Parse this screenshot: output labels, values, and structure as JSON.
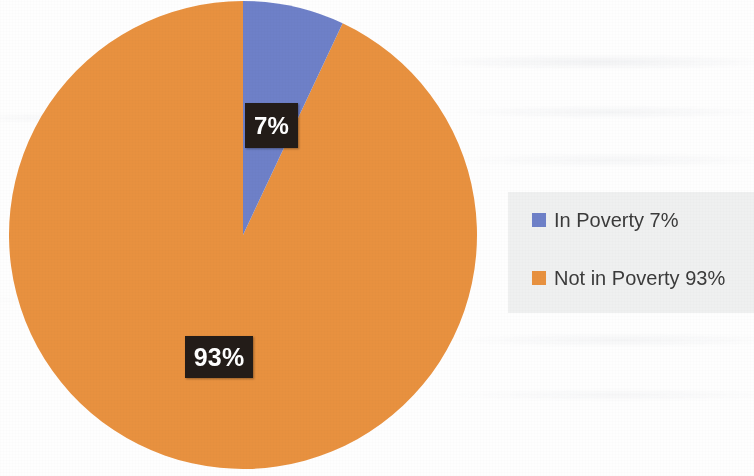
{
  "chart_data": {
    "type": "pie",
    "title": "",
    "subtitle": "",
    "categories": [
      "In Poverty",
      "Not in Poverty"
    ],
    "values": [
      7,
      93
    ],
    "unit": "%",
    "colors": [
      "#6e80c8",
      "#e8913f"
    ],
    "start_angle_deg": 0,
    "direction": "clockwise",
    "legend_position": "right",
    "grid": false,
    "data_labels": [
      "7%",
      "93%"
    ],
    "slices": [
      {
        "name": "In Poverty",
        "value": 7,
        "label": "7%",
        "legend_text": "In Poverty 7%",
        "color": "#6e80c8",
        "angle_deg": 25.2
      },
      {
        "name": "Not in Poverty",
        "value": 93,
        "label": "93%",
        "legend_text": "Not in Poverty 93%",
        "color": "#e8913f",
        "angle_deg": 334.8
      }
    ]
  },
  "pie": {
    "label_in_poverty": "7%",
    "label_not_in_poverty": "93%"
  },
  "legend": {
    "items": [
      {
        "label": "In Poverty 7%",
        "color": "#6e80c8",
        "swatch_name": "legend-swatch-in-poverty"
      },
      {
        "label": "Not in Poverty 93%",
        "color": "#e8913f",
        "swatch_name": "legend-swatch-not-in-poverty"
      }
    ]
  }
}
